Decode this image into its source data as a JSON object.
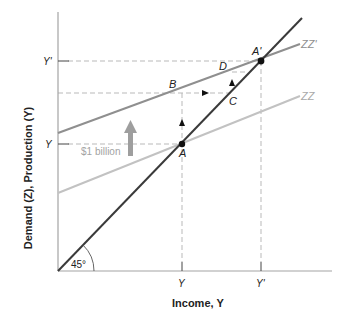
{
  "diagram": {
    "title": "",
    "y_axis_label": "Demand (Z), Production (Y)",
    "x_axis_label": "Income, Y",
    "x_ticks": [
      {
        "label": "Y",
        "x": 182
      },
      {
        "label": "Y'",
        "x": 261
      }
    ],
    "y_ticks": [
      {
        "label": "Y'",
        "y": 61
      },
      {
        "label": "Y",
        "y": 144
      }
    ],
    "lines": {
      "forty_five": {
        "label": "45°",
        "color": "#3a3a3a"
      },
      "zz_prime": {
        "label": "ZZ'",
        "color": "#8c8c8c"
      },
      "zz": {
        "label": "ZZ",
        "color": "#bdbdbd"
      }
    },
    "points": [
      {
        "label": "A",
        "x": 182,
        "y": 144
      },
      {
        "label": "A'",
        "x": 261,
        "y": 61
      },
      {
        "label": "B",
        "x": 203,
        "y": 93
      },
      {
        "label": "C",
        "x": 232,
        "y": 93
      },
      {
        "label": "D",
        "x": 232,
        "y": 73
      }
    ],
    "shift_annotation": "$1 billion",
    "colors": {
      "axis": "#9a9a9a",
      "dashed": "#b5b5b5",
      "text": "#222222",
      "shift_arrow": "#9e9e9e"
    }
  }
}
